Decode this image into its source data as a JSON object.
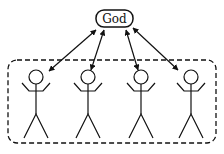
{
  "diagram": {
    "center_node": {
      "label": "God"
    },
    "group": {
      "style": "dashed-rounded-box",
      "member_count": 4
    },
    "members": [
      {
        "icon": "stick-figure",
        "cx": 36
      },
      {
        "icon": "stick-figure",
        "cx": 88
      },
      {
        "icon": "stick-figure",
        "cx": 141
      },
      {
        "icon": "stick-figure",
        "cx": 191
      }
    ],
    "edges": [
      {
        "from": "God",
        "to": "person-1",
        "type": "bidirectional-arrow"
      },
      {
        "from": "God",
        "to": "person-2",
        "type": "bidirectional-arrow"
      },
      {
        "from": "God",
        "to": "person-3",
        "type": "bidirectional-arrow"
      },
      {
        "from": "God",
        "to": "person-4",
        "type": "bidirectional-arrow"
      }
    ],
    "colors": {
      "stroke": "#111111",
      "background": "#ffffff"
    }
  }
}
